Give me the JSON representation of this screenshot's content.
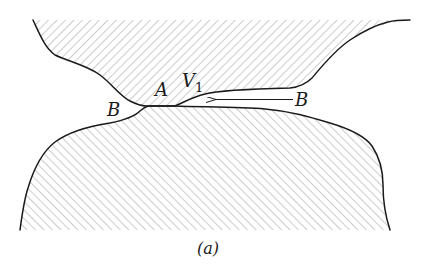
{
  "figure": {
    "caption": "(a)",
    "labels": {
      "left_region": "B",
      "contact_point": "A",
      "vector": "V",
      "vector_subscript": "1",
      "right_region": "B"
    },
    "arrow": {
      "direction": "left",
      "from_label": "B",
      "toward": "A"
    },
    "hatching": {
      "upper_body": "diagonal rising (/)",
      "lower_body": "diagonal falling (\\)",
      "color": "#9a9a9a"
    },
    "colors": {
      "outline": "#1a1a1a",
      "hatch": "#9a9a9a",
      "background": "#ffffff"
    }
  }
}
